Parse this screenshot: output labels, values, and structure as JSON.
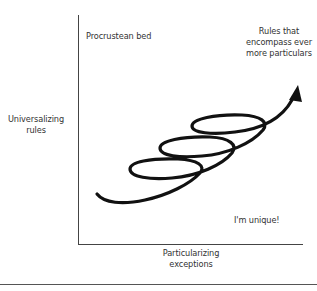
{
  "diagram": {
    "type": "conceptual quadrant diagram with spiral arrow",
    "axes": {
      "y_label_lines": [
        "Universalizing",
        "rules"
      ],
      "x_label_lines": [
        "Particularizing",
        "exceptions"
      ]
    },
    "annotations": {
      "top_left": "Procrustean bed",
      "top_right_lines": [
        "Rules that",
        "encompass ever",
        "more particulars"
      ],
      "bottom_right": "I'm unique!"
    },
    "spiral": {
      "description": "Helical arrow rising from lower-left to upper-right with three loops",
      "loops": 3,
      "direction": "up-right",
      "color": "#111111"
    },
    "colors": {
      "axis": "#444444",
      "text": "#333333",
      "spiral": "#111111",
      "background": "#ffffff"
    }
  }
}
